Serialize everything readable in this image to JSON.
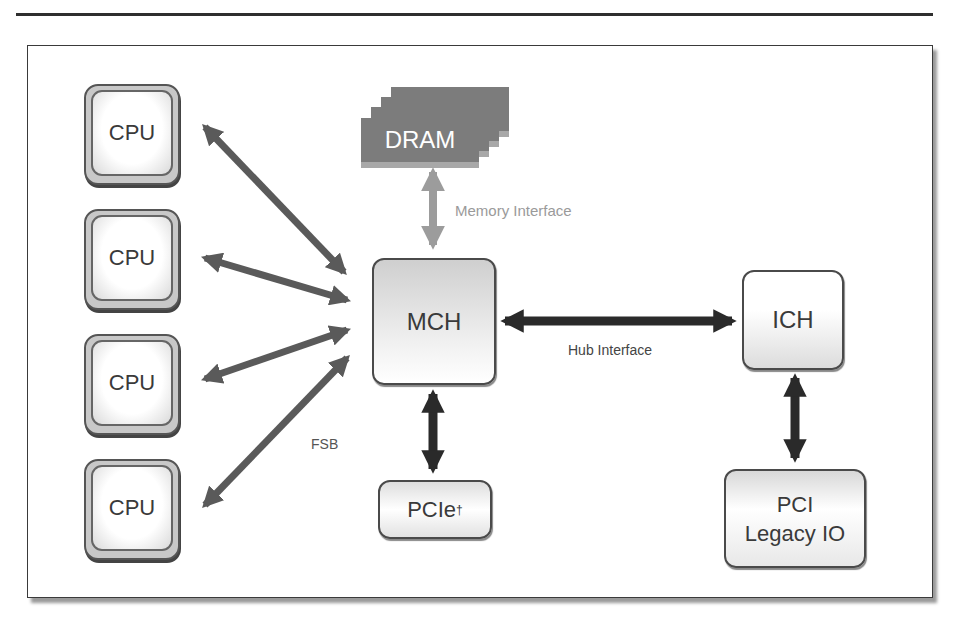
{
  "diagram": {
    "nodes": {
      "cpus": [
        "CPU",
        "CPU",
        "CPU",
        "CPU"
      ],
      "dram": "DRAM",
      "mch": "MCH",
      "ich": "ICH",
      "pcie": "PCIe",
      "pcie_mark": "†",
      "pci_line1": "PCI",
      "pci_line2": "Legacy IO"
    },
    "links": {
      "memory_interface": "Memory Interface",
      "hub_interface": "Hub Interface",
      "fsb": "FSB"
    },
    "colors": {
      "fsb_arrow": "#5a5a5a",
      "memory_arrow": "#9c9c9c",
      "hub_arrow": "#2a2a2a",
      "dram_fill": "#7c7c7c"
    }
  }
}
